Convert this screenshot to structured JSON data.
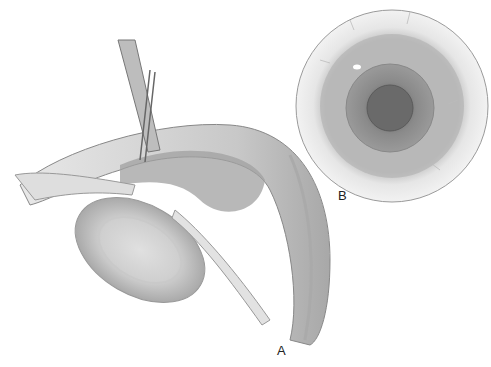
{
  "figure": {
    "panels": [
      {
        "id": "A",
        "label": "A",
        "description": "Cross-section of eye with instrument inserted through cornea into anterior chamber"
      },
      {
        "id": "B",
        "label": "B",
        "description": "Frontal view of eye showing iris and pupil"
      }
    ]
  }
}
